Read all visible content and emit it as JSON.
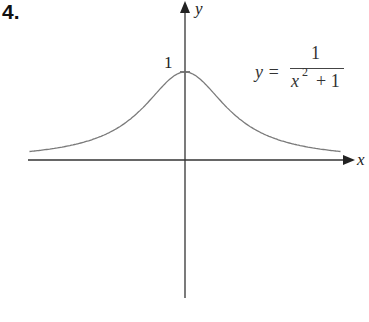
{
  "problem_number": "4.",
  "chart_data": {
    "type": "line",
    "title": "",
    "function": "y = 1/(x^2 + 1)",
    "series": [
      {
        "name": "y = 1/(x^2+1)",
        "x": [
          -3,
          -2.5,
          -2,
          -1.5,
          -1,
          -0.5,
          0,
          0.5,
          1,
          1.5,
          2,
          2.5,
          3
        ],
        "values": [
          0.1,
          0.138,
          0.2,
          0.308,
          0.5,
          0.8,
          1,
          0.8,
          0.5,
          0.308,
          0.2,
          0.138,
          0.1
        ]
      }
    ],
    "xlabel": "x",
    "ylabel": "y",
    "tick_labels": {
      "y": [
        "1"
      ]
    },
    "annotations": [
      "1"
    ],
    "grid": false,
    "legend": "none",
    "curve_color": "#7a7a7a",
    "axis_color": "#333333"
  },
  "axes": {
    "x_label": "x",
    "y_label": "y",
    "y_tick": "1"
  },
  "equation": {
    "lhs": "y =",
    "numerator": "1",
    "denominator_base": "x",
    "denominator_exp": "2",
    "denominator_rest": "+ 1"
  }
}
